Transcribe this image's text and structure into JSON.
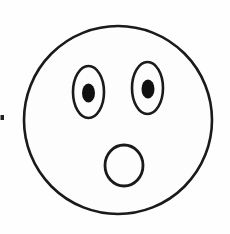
{
  "image": {
    "title": "Surprised Face Line Drawing",
    "subject": "emoticon-face",
    "expression": "surprised",
    "style": "black outline line art, white fill",
    "width": 230,
    "height": 234,
    "background_color": "#fefefe"
  },
  "palette": {
    "stroke": "#1a1a1a",
    "fill": "#fdfdfd",
    "pupil": "#111111",
    "background": "#fefefe",
    "speck": "#222222"
  },
  "shapes": {
    "face": {
      "name": "face-outline",
      "type": "circle",
      "cx": 118,
      "cy": 120,
      "r": 94,
      "stroke_width": 2.6,
      "fill": "#fdfdfd"
    },
    "left_eye": {
      "name": "left-eye",
      "type": "ellipse",
      "cx": 88.5,
      "cy": 92,
      "rx": 15.5,
      "ry": 26,
      "stroke_width": 2.6,
      "fill": "#fdfdfd"
    },
    "right_eye": {
      "name": "right-eye",
      "type": "ellipse",
      "cx": 147.5,
      "cy": 88,
      "rx": 15.5,
      "ry": 26,
      "stroke_width": 2.6,
      "fill": "#fdfdfd"
    },
    "left_pupil": {
      "name": "left-pupil",
      "type": "ellipse",
      "cx": 88.5,
      "cy": 93,
      "rx": 6.5,
      "ry": 9.5,
      "fill": "#111111"
    },
    "right_pupil": {
      "name": "right-pupil",
      "type": "ellipse",
      "cx": 148,
      "cy": 89,
      "rx": 6.5,
      "ry": 9.5,
      "fill": "#111111"
    },
    "mouth": {
      "name": "mouth-open-circle",
      "type": "ellipse",
      "cx": 124,
      "cy": 165.5,
      "rx": 19,
      "ry": 20.5,
      "stroke_width": 2.8,
      "fill": "#fdfdfd"
    },
    "edge_speck": {
      "name": "edge-speck-artifact",
      "type": "rect",
      "x": 0.5,
      "y": 115,
      "width": 3.5,
      "height": 5,
      "fill": "#222222"
    }
  }
}
